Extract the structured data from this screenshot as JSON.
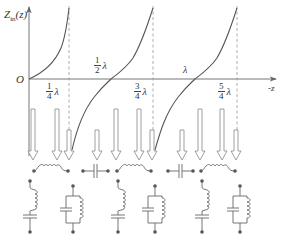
{
  "axes": {
    "y_label": "Z_in(z)",
    "y_label_main": "Z",
    "y_label_sub": "in",
    "y_label_arg": "(z)",
    "x_label": "-z",
    "origin_label": "O"
  },
  "markers": [
    {
      "num": "1",
      "den": "4",
      "unit": "λ",
      "name": "quarter-wavelength"
    },
    {
      "num": "1",
      "den": "2",
      "unit": "λ",
      "name": "half-wavelength"
    },
    {
      "num": "3",
      "den": "4",
      "unit": "λ",
      "name": "three-quarter-wavelength"
    },
    {
      "num": "",
      "den": "",
      "unit": "λ",
      "name": "one-wavelength"
    },
    {
      "num": "5",
      "den": "4",
      "unit": "λ",
      "name": "five-quarter-wavelength"
    }
  ],
  "curve": {
    "description": "Z_in = jZ0 tan(βz) — tangent-like branches with poles at λ/4, 3λ/4, 5λ/4",
    "color": "#555555"
  },
  "arrows": [
    {
      "x": 33,
      "long": true
    },
    {
      "x": 57,
      "long": true
    },
    {
      "x": 69,
      "long": false
    },
    {
      "x": 97,
      "long": false
    },
    {
      "x": 116,
      "long": true
    },
    {
      "x": 139,
      "long": true
    },
    {
      "x": 152,
      "long": false
    },
    {
      "x": 182,
      "long": false
    },
    {
      "x": 200,
      "long": true
    },
    {
      "x": 222,
      "long": true
    },
    {
      "x": 236,
      "long": false
    }
  ],
  "series_elements": [
    {
      "type": "inductor",
      "label": "series inductor (0 to λ/4)"
    },
    {
      "type": "capacitor",
      "label": "series capacitor (λ/4 to λ/2)"
    },
    {
      "type": "inductor",
      "label": "series inductor (λ/2 to 3λ/4)"
    },
    {
      "type": "capacitor",
      "label": "series capacitor (3λ/4 to λ)"
    },
    {
      "type": "inductor",
      "label": "series inductor (λ to 5λ/4)"
    }
  ],
  "resonant_circuits": [
    {
      "type": "series-LC",
      "label": "series resonance at 0"
    },
    {
      "type": "parallel-LC",
      "label": "parallel resonance at λ/4"
    },
    {
      "type": "series-LC",
      "label": "series resonance at λ/2"
    },
    {
      "type": "parallel-LC",
      "label": "parallel resonance at 3λ/4"
    },
    {
      "type": "series-LC",
      "label": "series resonance at λ"
    },
    {
      "type": "parallel-LC",
      "label": "parallel resonance at 5λ/4"
    }
  ],
  "colors": {
    "line": "#555555",
    "axis": "#666666",
    "dashed": "#999999",
    "arrow_stroke": "#888888",
    "dot": "#555555"
  }
}
